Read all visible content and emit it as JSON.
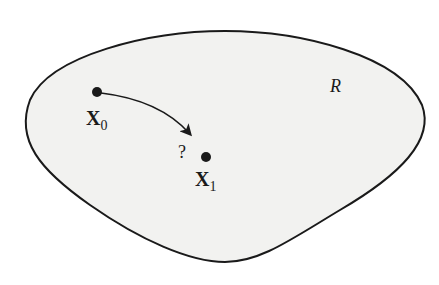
{
  "diagram": {
    "region_label": "R",
    "points": [
      {
        "name": "X",
        "subscript": "0"
      },
      {
        "name": "X",
        "subscript": "1"
      }
    ],
    "question_mark": "?",
    "colors": {
      "region_fill": "#f2f2f0",
      "stroke": "#1a1a1a",
      "background": "#ffffff"
    }
  }
}
